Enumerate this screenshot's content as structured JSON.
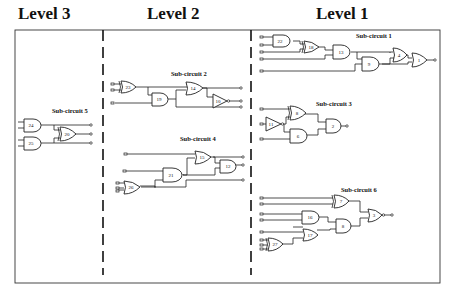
{
  "levels": [
    {
      "label": "Level 3",
      "x": 18
    },
    {
      "label": "Level 2",
      "x": 147
    },
    {
      "label": "Level 1",
      "x": 316
    }
  ],
  "subcircuits": {
    "sc1": "Sub-circuit 1",
    "sc2": "Sub-circuit 2",
    "sc3": "Sub-circuit 3",
    "sc4": "Sub-circuit 4",
    "sc5": "Sub-circuit 5",
    "sc6": "Sub-circuit 6"
  },
  "gates": {
    "g22": "22",
    "g18": "18",
    "g13": "13",
    "g9": "9",
    "g4": "4",
    "g1": "1",
    "g8": "8",
    "g11": "11",
    "g6": "6",
    "g2": "2",
    "g7": "7",
    "g16": "16",
    "g17": "17",
    "g27": "27",
    "g8b": "8",
    "g3": "3",
    "g23": "23",
    "g19": "19",
    "g14": "14",
    "g10": "10",
    "g15": "15",
    "g21": "21",
    "g12": "12",
    "g26": "26",
    "g24": "24",
    "g20": "20",
    "g25": "25"
  },
  "colors": {
    "line": "#222222",
    "background": "#ffffff"
  }
}
